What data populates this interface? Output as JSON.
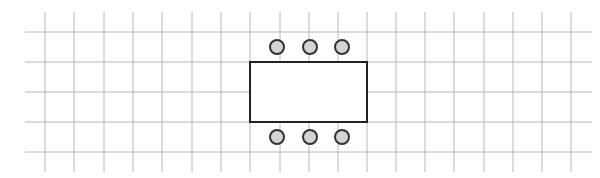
{
  "diagram": {
    "grid": {
      "color": "#b8b8b8",
      "vertical_x": [
        45,
        74,
        104,
        133,
        162,
        192,
        221,
        250,
        280,
        309,
        338,
        367,
        396,
        425,
        454,
        484,
        513,
        542,
        571
      ],
      "vertical_y_range": [
        12,
        172
      ],
      "horizontal_y": [
        32,
        62,
        92,
        122,
        152
      ],
      "horizontal_x_range": [
        25,
        592
      ]
    },
    "table": {
      "x": 250,
      "y": 62,
      "width": 117,
      "height": 60,
      "stroke": "#222222",
      "fill": "#ffffff"
    },
    "chairs": [
      {
        "cx": 277,
        "cy": 47,
        "r": 7
      },
      {
        "cx": 310,
        "cy": 47,
        "r": 7
      },
      {
        "cx": 342,
        "cy": 47,
        "r": 7
      },
      {
        "cx": 277,
        "cy": 137,
        "r": 7
      },
      {
        "cx": 310,
        "cy": 137,
        "r": 7
      },
      {
        "cx": 342,
        "cy": 137,
        "r": 7
      }
    ],
    "chair_fill": "#d4d4d4",
    "chair_stroke": "#333333"
  }
}
